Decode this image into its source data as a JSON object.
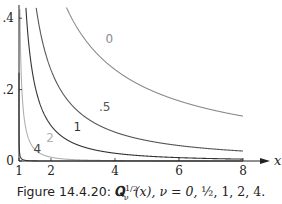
{
  "chart_data": {
    "type": "line",
    "title": "",
    "xlabel": "x",
    "ylabel": "",
    "xlim": [
      1,
      8
    ],
    "ylim": [
      0,
      0.42
    ],
    "x_ticks": [
      1,
      2,
      4,
      6,
      8
    ],
    "x_tick_labels": [
      "1",
      "2",
      "4",
      "6",
      "8"
    ],
    "y_ticks": [
      0,
      0.2,
      0.4
    ],
    "y_tick_labels": [
      "0",
      ".2",
      ".4"
    ],
    "grid": false,
    "legend": "inline curve labels",
    "series": [
      {
        "name": "0",
        "nu": 0,
        "color": "#8a8a8a",
        "x": [
          2.5,
          3,
          4,
          5,
          6,
          7,
          8
        ],
        "values": [
          0.427,
          0.348,
          0.256,
          0.204,
          0.169,
          0.144,
          0.126
        ],
        "label_pos": [
          3.7,
          0.33
        ]
      },
      {
        "name": ".5",
        "nu": 0.5,
        "color": "#555555",
        "x": [
          1.3,
          1.5,
          2,
          3,
          4,
          6,
          8
        ],
        "values": [
          0.42,
          0.33,
          0.2,
          0.1,
          0.066,
          0.034,
          0.025
        ],
        "label_pos": [
          3.5,
          0.14
        ]
      },
      {
        "name": "1",
        "nu": 1,
        "color": "#333333",
        "x": [
          1.08,
          1.2,
          1.5,
          2,
          3,
          4,
          6,
          8
        ],
        "values": [
          0.42,
          0.3,
          0.17,
          0.095,
          0.039,
          0.02,
          0.008,
          0.005
        ],
        "label_pos": [
          2.7,
          0.085
        ]
      },
      {
        "name": "2",
        "nu": 2,
        "color": "#b0b0b0",
        "x": [
          1.01,
          1.05,
          1.1,
          1.2,
          1.5,
          2,
          3,
          4
        ],
        "values": [
          0.42,
          0.22,
          0.14,
          0.075,
          0.022,
          0.006,
          0.001,
          0.0003
        ],
        "label_pos": [
          1.85,
          0.052
        ]
      },
      {
        "name": "4",
        "nu": 4,
        "color": "#444444",
        "x": [
          1.001,
          1.01,
          1.03,
          1.06,
          1.1,
          1.2,
          1.5
        ],
        "values": [
          0.42,
          0.13,
          0.05,
          0.022,
          0.01,
          0.003,
          0.0003
        ],
        "label_pos": [
          1.45,
          0.022
        ]
      }
    ]
  },
  "axis": {
    "x_label": "x"
  },
  "caption": {
    "prefix": "Figure 14.4.20:",
    "math": "𝑸",
    "sup": "1/2",
    "sub": "ν",
    "rest": "(x), ν = 0, ",
    "half": "½",
    "tail": ", 1, 2, 4."
  }
}
